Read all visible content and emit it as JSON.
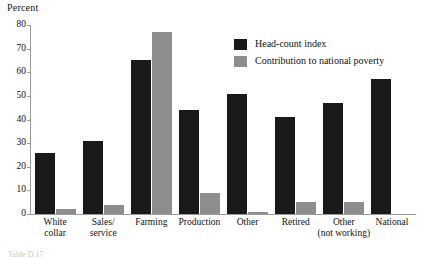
{
  "chart_data": {
    "type": "bar",
    "title": "",
    "xlabel": "",
    "ylabel": "Percent",
    "ylim": [
      0,
      80
    ],
    "ytick_step": 10,
    "yticks": [
      80,
      70,
      60,
      50,
      40,
      30,
      20,
      10,
      0
    ],
    "grid": false,
    "legend_position": "upper-right-inside",
    "categories": [
      "White\ncollar",
      "Sales/\nservice",
      "Farming",
      "Production",
      "Other",
      "Retired",
      "Other\n(not working)",
      "National"
    ],
    "series": [
      {
        "name": "Head-count index",
        "color": "#1a1a1a",
        "values": [
          26,
          31,
          65,
          44,
          51,
          41,
          47,
          57
        ]
      },
      {
        "name": "Contribution to national poverty",
        "color": "#8d8d8d",
        "values": [
          2,
          4,
          77,
          9,
          1,
          5,
          5,
          0
        ]
      }
    ]
  },
  "axis": {
    "y_title": "Percent"
  },
  "legend": {
    "items": [
      {
        "label": "Head-count index",
        "color": "#1a1a1a"
      },
      {
        "label": "Contribution to national poverty",
        "color": "#8d8d8d"
      }
    ]
  },
  "caption_fragment": {
    "text": "Table D.17"
  }
}
